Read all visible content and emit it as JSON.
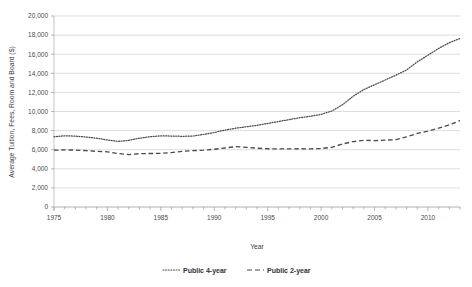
{
  "chart_data": {
    "type": "line",
    "title": "",
    "xlabel": "Year",
    "ylabel": "Average Tuition, Fees, Room and Board ($)",
    "xlim": [
      1975,
      2013
    ],
    "ylim": [
      0,
      20000
    ],
    "grid": true,
    "legend_position": "bottom",
    "x_ticks": [
      "1975",
      "1980",
      "1985",
      "1990",
      "1995",
      "2000",
      "2005",
      "2010"
    ],
    "x_tick_values": [
      1975,
      1980,
      1985,
      1990,
      1995,
      2000,
      2005,
      2010
    ],
    "y_ticks": [
      "0",
      "2,000",
      "4,000",
      "6,000",
      "8,000",
      "10,000",
      "12,000",
      "14,000",
      "16,000",
      "18,000",
      "20,000"
    ],
    "y_tick_values": [
      0,
      2000,
      4000,
      6000,
      8000,
      10000,
      12000,
      14000,
      16000,
      18000,
      20000
    ],
    "x": [
      1975,
      1976,
      1977,
      1978,
      1979,
      1980,
      1981,
      1982,
      1983,
      1984,
      1985,
      1986,
      1987,
      1988,
      1989,
      1990,
      1991,
      1992,
      1993,
      1994,
      1995,
      1996,
      1997,
      1998,
      1999,
      2000,
      2001,
      2002,
      2003,
      2004,
      2005,
      2006,
      2007,
      2008,
      2009,
      2010,
      2011,
      2012,
      2013
    ],
    "series": [
      {
        "name": "Public 4-year",
        "style": "dotted",
        "color": "#555555",
        "values": [
          7350,
          7460,
          7420,
          7330,
          7200,
          7020,
          6870,
          6980,
          7200,
          7360,
          7450,
          7430,
          7400,
          7430,
          7600,
          7800,
          8050,
          8250,
          8400,
          8550,
          8750,
          8950,
          9150,
          9350,
          9500,
          9700,
          10050,
          10700,
          11600,
          12300,
          12800,
          13300,
          13800,
          14350,
          15200,
          15900,
          16600,
          17200,
          17650
        ]
      },
      {
        "name": "Public 2-year",
        "style": "dashed",
        "color": "#444444",
        "values": [
          5950,
          5980,
          5960,
          5900,
          5830,
          5780,
          5600,
          5480,
          5580,
          5600,
          5620,
          5700,
          5830,
          5900,
          5950,
          6050,
          6180,
          6320,
          6250,
          6160,
          6100,
          6080,
          6080,
          6100,
          6090,
          6120,
          6250,
          6600,
          6850,
          6980,
          6950,
          7000,
          7050,
          7350,
          7700,
          7950,
          8250,
          8600,
          9050
        ]
      }
    ],
    "legend": [
      {
        "label": "Public 4-year",
        "style": "dotted"
      },
      {
        "label": "Public 2-year",
        "style": "dashed"
      }
    ]
  },
  "axis": {
    "y_title": "Average Tuition, Fees, Room and Board ($)",
    "x_title": "Year"
  },
  "legend_entries": {
    "first": "Public 4-year",
    "second": "Public 2-year"
  }
}
